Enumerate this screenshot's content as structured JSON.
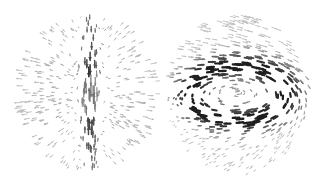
{
  "figure": {
    "panels": [
      {
        "id": "left",
        "field_type": "radial-converging",
        "description": "Arrows pointing along vertical axis toward center from top and bottom, with radial spread",
        "color_dark": "#2a2a2a",
        "color_light": "#c8c8c8"
      },
      {
        "id": "right",
        "field_type": "vortex-toroidal",
        "description": "Arrows circulating around a vertical axis forming an elliptical swirl",
        "color_dark": "#1e1e1e",
        "color_light": "#c8c8c8"
      }
    ]
  }
}
